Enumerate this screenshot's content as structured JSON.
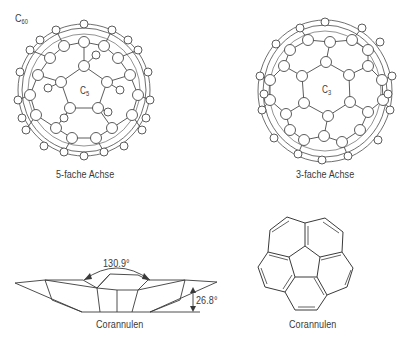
{
  "figure": {
    "molecule_label": "C",
    "molecule_sub": "60",
    "panels": [
      {
        "id": "c60-5fold",
        "center_label": "C",
        "center_sub": "5",
        "caption": "5-fache Achse"
      },
      {
        "id": "c60-3fold",
        "center_label": "C",
        "center_sub": "3",
        "caption": "3-fache Achse"
      },
      {
        "id": "corannulen-side",
        "angle_top": "130.9°",
        "angle_side": "26.8°",
        "caption": "Corannulen"
      },
      {
        "id": "corannulen-top",
        "caption": "Corannulen"
      }
    ]
  },
  "colors": {
    "line": "#4a4a4a",
    "atom_fill": "#ffffff",
    "text": "#3a3a3a"
  }
}
